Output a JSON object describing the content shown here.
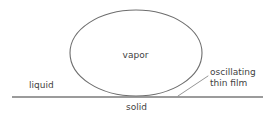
{
  "diagram": {
    "labels": {
      "vapor": "vapor",
      "liquid": "liquid",
      "solid": "solid",
      "callout_line1": "oscillating",
      "callout_line2": "thin film"
    },
    "colors": {
      "stroke": "#6e6e6e",
      "surface_line": "#7a7a7a",
      "text": "#3f3f3f",
      "background": "#ffffff"
    },
    "geometry": {
      "bubble": {
        "shape": "ellipse",
        "cx": 136,
        "cy": 53,
        "rx": 66,
        "ry": 43
      },
      "surface_line": {
        "x1": 12,
        "y1": 97,
        "x2": 263,
        "y2": 97
      },
      "leader_line": {
        "x1": 178,
        "y1": 96,
        "x2": 208,
        "y2": 76
      }
    }
  }
}
